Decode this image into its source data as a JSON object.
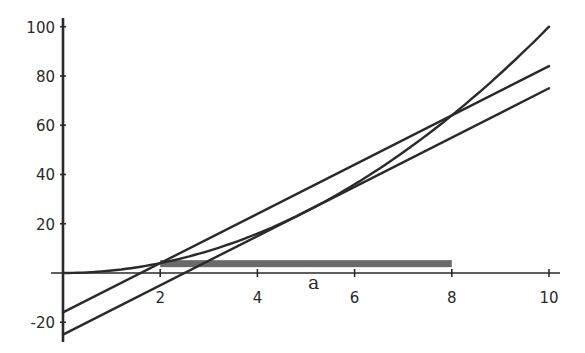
{
  "chart_data": {
    "type": "line",
    "title": "",
    "xlabel": "a",
    "ylabel": "",
    "xlim": [
      0,
      10
    ],
    "ylim": [
      -25,
      100
    ],
    "grid": false,
    "legend": null,
    "x_ticks": [
      2,
      4,
      6,
      8,
      10
    ],
    "x_tick_labels": [
      "2",
      "4",
      "6",
      "8",
      "10"
    ],
    "y_ticks": [
      -20,
      20,
      40,
      60,
      80,
      100
    ],
    "y_tick_labels": [
      "-20",
      "20",
      "40",
      "60",
      "80",
      "100"
    ],
    "series": [
      {
        "name": "curve (a^2)",
        "kind": "curve",
        "x": [
          0,
          1,
          2,
          3,
          4,
          5,
          6,
          7,
          8,
          9,
          10
        ],
        "values": [
          0,
          1,
          4,
          9,
          16,
          25,
          36,
          49,
          64,
          81,
          100
        ]
      },
      {
        "name": "secant line",
        "kind": "line",
        "x": [
          0,
          10
        ],
        "values": [
          -16,
          84
        ]
      },
      {
        "name": "tangent line",
        "kind": "line",
        "x": [
          0,
          10
        ],
        "values": [
          -25,
          75
        ]
      }
    ],
    "annotations": [
      {
        "type": "shaded-bar",
        "x_start": 2,
        "x_end": 8,
        "y": 4,
        "color": "#6a6a6a"
      }
    ]
  },
  "colors": {
    "line": "#2a2a2a",
    "bar": "#6a6a6a",
    "background": "#ffffff"
  }
}
